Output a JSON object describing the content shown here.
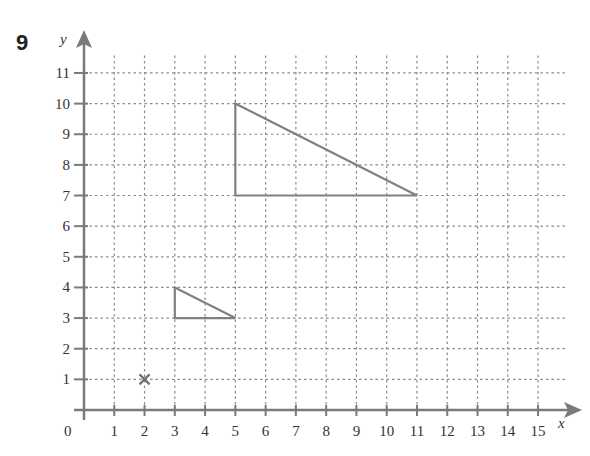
{
  "question": {
    "number": "9"
  },
  "grid": {
    "origin_px": [
      84,
      410
    ],
    "unit_x_px": 30.27,
    "unit_y_px": 30.64,
    "x_max": 15,
    "y_max": 11,
    "grid_right_px": 567,
    "grid_top_px": 55,
    "axis_color": "#7a7a7a",
    "grid_color": "#8a8a8a",
    "shape_color": "#808080"
  },
  "axes": {
    "x_label": "x",
    "y_label": "y",
    "origin_label": "0",
    "x_ticks": [
      "1",
      "2",
      "3",
      "4",
      "5",
      "6",
      "7",
      "8",
      "9",
      "10",
      "11",
      "12",
      "13",
      "14",
      "15"
    ],
    "y_ticks": [
      "1",
      "2",
      "3",
      "4",
      "5",
      "6",
      "7",
      "8",
      "9",
      "10",
      "11"
    ]
  },
  "shapes": [
    {
      "name": "small-triangle",
      "vertices": [
        [
          3,
          4
        ],
        [
          3,
          3
        ],
        [
          5,
          3
        ]
      ]
    },
    {
      "name": "large-triangle",
      "vertices": [
        [
          5,
          10
        ],
        [
          5,
          7
        ],
        [
          11,
          7
        ]
      ]
    }
  ],
  "markers": [
    {
      "name": "centre-of-enlargement-cross",
      "point": [
        2,
        1
      ],
      "symbol": "x"
    }
  ]
}
